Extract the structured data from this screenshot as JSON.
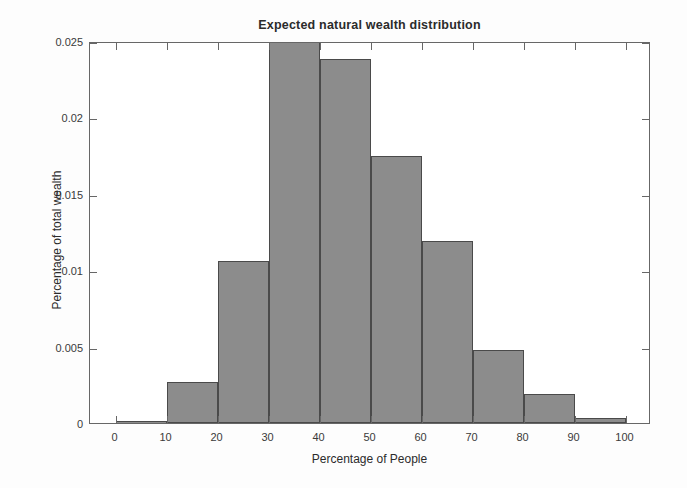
{
  "chart_data": {
    "type": "bar",
    "title": "Expected natural wealth distribution",
    "xlabel": "Percentage of People",
    "ylabel": "Percentage of total wealth",
    "xlim": [
      -5,
      105
    ],
    "ylim": [
      0,
      0.025
    ],
    "grid": false,
    "legend": null,
    "bin_width": 10,
    "x_ticks": [
      "0",
      "10",
      "20",
      "30",
      "40",
      "50",
      "60",
      "70",
      "80",
      "90",
      "100"
    ],
    "x_tick_values": [
      0,
      10,
      20,
      30,
      40,
      50,
      60,
      70,
      80,
      90,
      100
    ],
    "y_ticks": [
      "0",
      "0.005",
      "0.01",
      "0.015",
      "0.02",
      "0.025"
    ],
    "y_tick_values": [
      0,
      0.005,
      0.01,
      0.015,
      0.02,
      0.025
    ],
    "categories": [
      "0-10",
      "10-20",
      "20-30",
      "30-40",
      "40-50",
      "50-60",
      "60-70",
      "70-80",
      "80-90",
      "90-100"
    ],
    "bin_edges": [
      0,
      10,
      20,
      30,
      40,
      50,
      60,
      70,
      80,
      90,
      100
    ],
    "values": [
      0.0001,
      0.0027,
      0.0106,
      0.0262,
      0.0238,
      0.0175,
      0.0119,
      0.0048,
      0.0019,
      0.0003
    ],
    "colors": {
      "bar_fill": "#8c8c8c",
      "bar_edge": "#4a4a4a",
      "axis": "#676767",
      "text": "#2b2b2b",
      "background": "#ffffff"
    }
  }
}
